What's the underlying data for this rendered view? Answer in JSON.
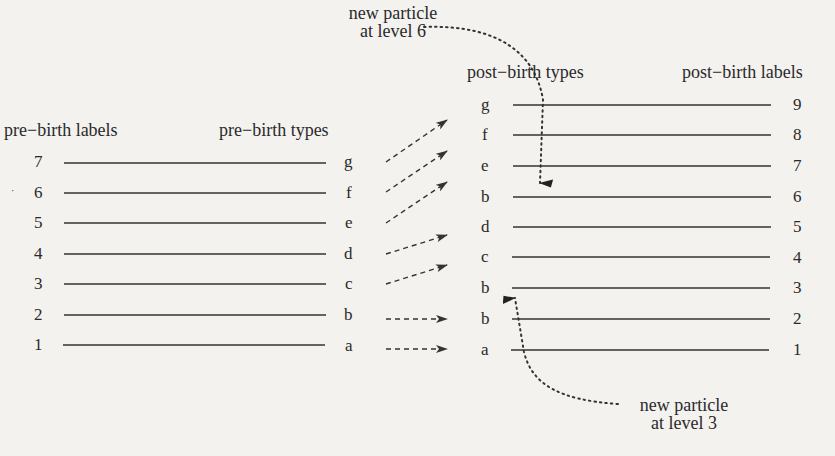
{
  "headers": {
    "pre_labels": "pre−birth labels",
    "pre_types": "pre−birth types",
    "post_types": "post−birth types",
    "post_labels": "post−birth labels"
  },
  "annotations": {
    "top": {
      "line1": "new particle",
      "line2": "at level 6"
    },
    "bottom": {
      "line1": "new particle",
      "line2": "at level 3"
    }
  },
  "pre_birth": [
    {
      "label": "7",
      "type": "g"
    },
    {
      "label": "6",
      "type": "f"
    },
    {
      "label": "5",
      "type": "e"
    },
    {
      "label": "4",
      "type": "d"
    },
    {
      "label": "3",
      "type": "c"
    },
    {
      "label": "2",
      "type": "b"
    },
    {
      "label": "1",
      "type": "a"
    }
  ],
  "post_birth": [
    {
      "label": "9",
      "type": "g"
    },
    {
      "label": "8",
      "type": "f"
    },
    {
      "label": "7",
      "type": "e"
    },
    {
      "label": "6",
      "type": "b"
    },
    {
      "label": "5",
      "type": "d"
    },
    {
      "label": "4",
      "type": "c"
    },
    {
      "label": "3",
      "type": "b"
    },
    {
      "label": "2",
      "type": "b"
    },
    {
      "label": "1",
      "type": "a"
    }
  ],
  "mappings": [
    {
      "from": "g",
      "to_level": 9
    },
    {
      "from": "f",
      "to_level": 8
    },
    {
      "from": "e",
      "to_level": 7
    },
    {
      "from": "d",
      "to_level": 5
    },
    {
      "from": "c",
      "to_level": 4
    },
    {
      "from": "b",
      "to_level": 2
    },
    {
      "from": "a",
      "to_level": 1
    }
  ]
}
